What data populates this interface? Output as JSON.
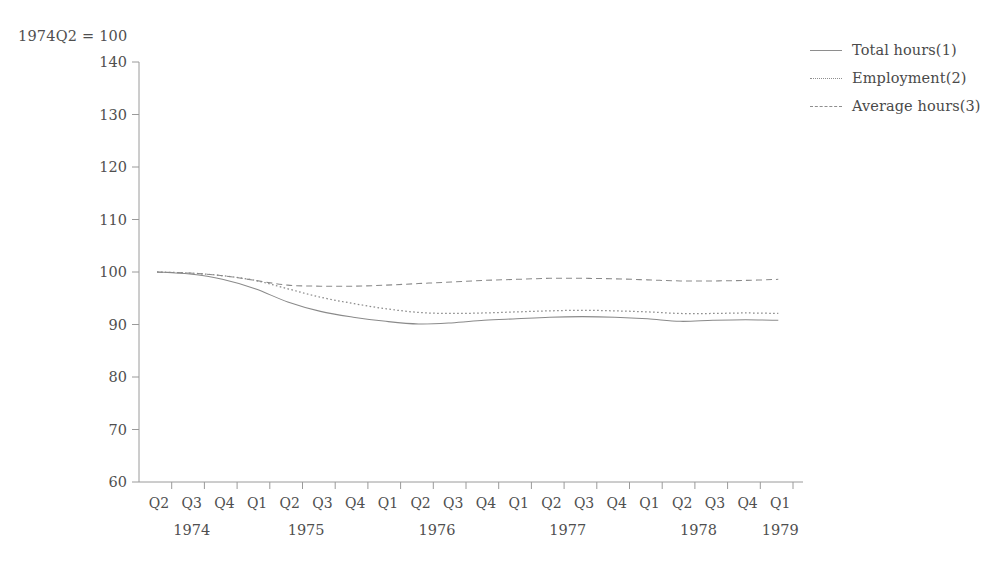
{
  "index_note": "1974Q2 = 100",
  "legend": {
    "entries": [
      {
        "label": "Total hours(1)",
        "style": "solid"
      },
      {
        "label": "Employment(2)",
        "style": "dotted"
      },
      {
        "label": "Average hours(3)",
        "style": "dashed"
      }
    ]
  },
  "chart_data": {
    "type": "line",
    "title": "",
    "subtitle": "",
    "xlabel": "",
    "ylabel": "1974Q2 = 100",
    "ylim": [
      60,
      140
    ],
    "yticks": [
      60,
      70,
      80,
      90,
      100,
      110,
      120,
      130,
      140
    ],
    "grid": false,
    "legend_position": "top-right",
    "x": [
      "1974Q2",
      "1974Q3",
      "1974Q4",
      "1975Q1",
      "1975Q2",
      "1975Q3",
      "1975Q4",
      "1976Q1",
      "1976Q2",
      "1976Q3",
      "1976Q4",
      "1977Q1",
      "1977Q2",
      "1977Q3",
      "1977Q4",
      "1978Q1",
      "1978Q2",
      "1978Q3",
      "1978Q4",
      "1979Q1"
    ],
    "quarter_labels": [
      "Q2",
      "Q3",
      "Q4",
      "Q1",
      "Q2",
      "Q3",
      "Q4",
      "Q1",
      "Q2",
      "Q3",
      "Q4",
      "Q1",
      "Q2",
      "Q3",
      "Q4",
      "Q1",
      "Q2",
      "Q3",
      "Q4",
      "Q1"
    ],
    "year_groups": [
      {
        "year": "1974",
        "start_index": 0,
        "end_index": 2
      },
      {
        "year": "1975",
        "start_index": 3,
        "end_index": 6
      },
      {
        "year": "1976",
        "start_index": 7,
        "end_index": 10
      },
      {
        "year": "1977",
        "start_index": 11,
        "end_index": 14
      },
      {
        "year": "1978",
        "start_index": 15,
        "end_index": 18
      },
      {
        "year": "1979",
        "start_index": 19,
        "end_index": 19
      }
    ],
    "series": [
      {
        "name": "Total hours(1)",
        "style": "solid",
        "values": [
          100.0,
          99.6,
          98.6,
          96.8,
          94.3,
          92.5,
          91.4,
          90.6,
          90.1,
          90.3,
          90.8,
          91.1,
          91.4,
          91.5,
          91.4,
          91.1,
          90.6,
          90.8,
          90.9,
          90.8
        ]
      },
      {
        "name": "Employment(2)",
        "style": "dotted",
        "values": [
          100.0,
          99.8,
          99.3,
          98.4,
          96.8,
          95.2,
          94.0,
          93.0,
          92.3,
          92.1,
          92.2,
          92.4,
          92.6,
          92.7,
          92.6,
          92.4,
          92.1,
          92.1,
          92.2,
          92.1
        ]
      },
      {
        "name": "Average hours(3)",
        "style": "dashed",
        "values": [
          100.0,
          99.8,
          99.3,
          98.4,
          97.5,
          97.3,
          97.3,
          97.5,
          97.8,
          98.1,
          98.4,
          98.6,
          98.8,
          98.8,
          98.7,
          98.5,
          98.3,
          98.3,
          98.4,
          98.6
        ]
      }
    ]
  }
}
